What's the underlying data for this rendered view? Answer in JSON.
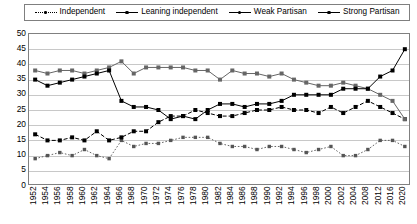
{
  "legend": {
    "position": "top",
    "entries": [
      {
        "label": "Independent",
        "marker": "dotted-line-square",
        "color": "#555555"
      },
      {
        "label": "Leaning independent",
        "marker": "dashed-line-square",
        "color": "#000000"
      },
      {
        "label": "Weak Partisan",
        "marker": "solid-line-square",
        "color": "#666666"
      },
      {
        "label": "Strong Partisan",
        "marker": "solid-line-diamond",
        "color": "#000000"
      }
    ]
  },
  "chart_data": {
    "type": "line",
    "title": "",
    "xlabel": "",
    "ylabel": "",
    "ylim": [
      0,
      50
    ],
    "ytick_step": 5,
    "yticks": [
      50,
      45,
      40,
      35,
      30,
      25,
      20,
      15,
      10,
      5,
      0
    ],
    "grid": true,
    "x": [
      "1952",
      "1954",
      "1956",
      "1958",
      "1960",
      "1962",
      "1964",
      "1966",
      "1968",
      "1970",
      "1972",
      "1974",
      "1976",
      "1978",
      "1980",
      "1982",
      "1984",
      "1986",
      "1988",
      "1990",
      "1992",
      "1994",
      "1996",
      "1998",
      "2000",
      "2002",
      "2004",
      "2008",
      "2012",
      "2016",
      "2020"
    ],
    "series": [
      {
        "name": "Independent",
        "style": "dotted",
        "color": "#555555",
        "values": [
          9,
          10,
          11,
          10,
          12,
          10,
          9,
          15,
          13,
          14,
          14,
          15,
          16,
          16,
          16,
          14,
          13,
          13,
          12,
          13,
          13,
          12,
          11,
          12,
          13,
          10,
          10,
          12,
          15,
          15,
          13
        ]
      },
      {
        "name": "Leaning independent",
        "style": "dashed",
        "color": "#000000",
        "values": [
          17,
          15,
          15,
          16,
          15,
          18,
          15,
          16,
          18,
          18,
          21,
          23,
          23,
          25,
          24,
          23,
          23,
          24,
          25,
          25,
          26,
          25,
          25,
          24,
          26,
          24,
          26,
          28,
          26,
          24,
          22
        ]
      },
      {
        "name": "Weak Partisan",
        "style": "solid",
        "color": "#666666",
        "values": [
          38,
          37,
          38,
          38,
          37,
          38,
          39,
          41,
          37,
          39,
          39,
          39,
          39,
          38,
          38,
          35,
          38,
          37,
          37,
          36,
          37,
          35,
          34,
          33,
          33,
          34,
          33,
          32,
          30,
          28,
          22
        ]
      },
      {
        "name": "Strong Partisan",
        "style": "solid",
        "color": "#000000",
        "values": [
          35,
          33,
          34,
          35,
          36,
          37,
          38,
          28,
          26,
          26,
          25,
          22,
          23,
          22,
          25,
          27,
          27,
          26,
          27,
          27,
          28,
          30,
          30,
          30,
          30,
          32,
          32,
          32,
          36,
          38,
          45
        ]
      }
    ]
  }
}
